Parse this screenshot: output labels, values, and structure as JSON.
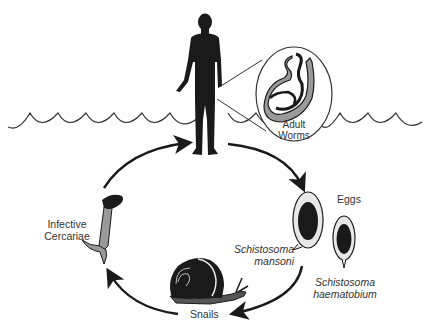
{
  "diagram": {
    "labels": {
      "adult_worms": [
        "Adult",
        "Worms"
      ],
      "eggs": "Eggs",
      "mansoni": [
        "Schistosoma",
        "mansoni"
      ],
      "haematobium": [
        "Schistosoma",
        "haematobium"
      ],
      "snails": "Snails",
      "cercariae": [
        "Infective",
        "Cercariae"
      ]
    },
    "stages": [
      {
        "id": "human-host",
        "icon": "human-silhouette"
      },
      {
        "id": "adult-worms",
        "icon": "worm-pair-magnified"
      },
      {
        "id": "eggs",
        "icon": "egg-oval"
      },
      {
        "id": "snails",
        "icon": "snail"
      },
      {
        "id": "infective-cercariae",
        "icon": "cercaria-forked-tail"
      }
    ],
    "cycle_direction": "clockwise",
    "colors": {
      "ink": "#1a1a1a",
      "gray_fill": "#9a9a9a",
      "light_fill": "#e8e8e8",
      "background": "#ffffff"
    }
  }
}
